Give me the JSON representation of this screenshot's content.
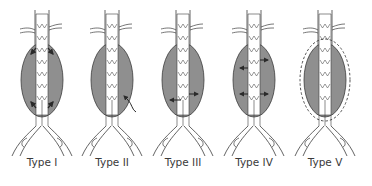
{
  "diagram": {
    "colors": {
      "sac_fill": "#8f8f8f",
      "line": "#3c3c3c",
      "stent": "#ffffff",
      "arrow": "#2a2a2a"
    },
    "panels": [
      {
        "label": "Type I",
        "cx": 42,
        "arrows": "proximal-and-distal-attachment"
      },
      {
        "label": "Type II",
        "cx": 112,
        "arrows": "branch-vessel-retrograde"
      },
      {
        "label": "Type III",
        "cx": 183,
        "arrows": "graft-junction"
      },
      {
        "label": "Type IV",
        "cx": 254,
        "arrows": "graft-porosity"
      },
      {
        "label": "Type V",
        "cx": 325,
        "arrows": "endotension-dashed-outline"
      }
    ]
  }
}
